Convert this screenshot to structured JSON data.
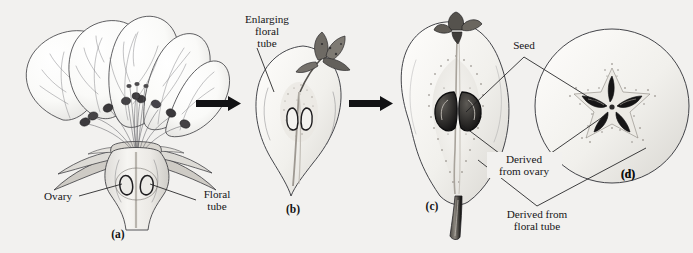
{
  "figure": {
    "background_color": "#f2f1ef",
    "ink_color": "#2a2a2d",
    "panel_count": 4
  },
  "panels": [
    {
      "id": "a",
      "marker": "(a)",
      "description": "Longitudinal section of pear flower showing petals, stamens with anthers, sepals, ovary and floral tube"
    },
    {
      "id": "b",
      "marker": "(b)",
      "description": "Longitudinal section of young fruit with enlarging floral tube and withered floral parts at apex"
    },
    {
      "id": "c",
      "marker": "(c)",
      "description": "Longitudinal section of mature pear showing seeds, core derived from ovary, and flesh derived from floral tube"
    },
    {
      "id": "d",
      "marker": "(d)",
      "description": "Transverse section of mature pear showing five-pointed star core with seeds"
    }
  ],
  "labels": {
    "ovary": "Ovary",
    "floral_tube_line1": "Floral",
    "floral_tube_line2": "tube",
    "enlarging_line1": "Enlarging",
    "enlarging_line2": "floral",
    "enlarging_line3": "tube",
    "seed": "Seed",
    "derived_ovary_line1": "Derived",
    "derived_ovary_line2": "from ovary",
    "derived_tube_line1": "Derived from",
    "derived_tube_line2": "floral tube"
  },
  "markers": {
    "a": "(a)",
    "b": "(b)",
    "c": "(c)",
    "d": "(d)"
  },
  "arrows": [
    {
      "name": "arrow-a-to-b",
      "direction": "right"
    },
    {
      "name": "arrow-b-to-c",
      "direction": "right"
    }
  ]
}
